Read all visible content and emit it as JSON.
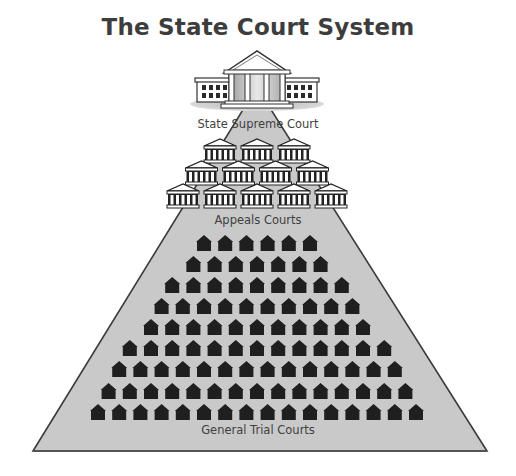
{
  "title": "The State Court System",
  "levels": {
    "supreme": {
      "label": "State Supreme Court",
      "count": 1,
      "icon": "large-courthouse-icon"
    },
    "appeals": {
      "label": "Appeals Courts",
      "rows": [
        3,
        4,
        5
      ],
      "icon": "temple-courthouse-icon"
    },
    "trial": {
      "label": "General Trial Courts",
      "rows": [
        6,
        7,
        9,
        10,
        11,
        13,
        14,
        15,
        16
      ],
      "icon": "house-icon"
    }
  },
  "colors": {
    "pyramid_fill": "#c8c8c8",
    "pyramid_stroke": "#3a3a3a",
    "house": "#1f1f1f",
    "text": "#3f3f3f"
  }
}
